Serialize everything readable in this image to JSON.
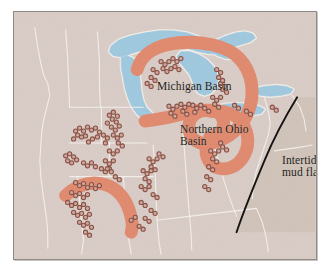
{
  "figure": {
    "kind": "paleogeographic-map",
    "region": "Great Lakes region, United States",
    "frame_border_color": "#8e8a86",
    "page_background": "#ffffff"
  },
  "colors": {
    "land": "#d9ccc6",
    "lake_water": "#9fc8de",
    "lake_outline": "#f2ece8",
    "reef_band": "#e08a6f",
    "mudflat_fill": "#c8bcae",
    "mudflat_line": "#141210",
    "state_border": "#f4efeb",
    "locality_dot_stroke": "#8a5146",
    "locality_dot_fill": "#cfa89c",
    "label_text": "#241f1c"
  },
  "labels": {
    "michigan_basin": "Michigan Basin",
    "northern_ohio_basin_line1": "Northern Ohio",
    "northern_ohio_basin_line2": "Basin",
    "intertidal_line1": "Intertidal",
    "intertidal_line2": "mud flats"
  },
  "legend_semantics": {
    "reef_band_meaning": "Reef trend / carbonate bank margin",
    "dot_meaning": "Fossil locality",
    "mudflat_meaning": "Intertidal mud flats"
  },
  "map_data": {
    "type": "map",
    "lakes": [
      {
        "name": "Lake Superior",
        "path": "M98,34 L106,28 L118,24 L132,21 L146,19 L160,19 L174,21 L186,25 L196,30 L205,28 L214,24 L224,21 L233,20 L240,22 L243,26 L238,30 L228,33 L219,36 L212,40 L205,42 L196,42 L186,40 L176,37 L166,35 L155,34 L144,35 L134,37 L124,40 L115,43 L107,45 L100,44 L96,40 Z"
      },
      {
        "name": "Lake Michigan",
        "path": "M108,45 L114,44 L120,47 L124,53 L126,61 L127,70 L128,80 L130,89 L133,96 L138,101 L140,106 L136,109 L130,108 L124,103 L119,96 L115,87 L112,77 L110,66 L108,56 Z"
      },
      {
        "name": "Lake Huron",
        "path": "M168,40 L177,40 L186,43 L194,48 L200,54 L204,61 L205,69 L203,77 L198,82 L192,84 L186,82 L182,77 L180,70 L177,63 L172,57 L167,51 L164,45 Z"
      },
      {
        "name": "Georgian Bay",
        "path": "M196,34 L205,32 L214,33 L221,37 L224,43 L220,47 L213,47 L205,44 L198,40 Z"
      },
      {
        "name": "Lake Erie",
        "path": "M200,96 L212,93 L224,92 L236,93 L246,95 L252,98 L249,102 L240,104 L228,105 L215,104 L205,101 Z"
      },
      {
        "name": "Lake Ontario",
        "path": "M240,78 L252,75 L264,74 L274,75 L281,78 L278,82 L269,84 L258,85 L248,84 L241,82 Z"
      }
    ],
    "reef_bands": [
      {
        "name": "Michigan Basin reef rim",
        "path": "M124,58 C128,42 144,33 166,31 C190,29 214,34 226,46 C240,60 243,82 236,100 C230,116 216,128 200,132 C186,135 176,128 176,116 C176,106 184,100 194,99 C204,98 211,104 211,112 C211,120 205,126 197,126"
      },
      {
        "name": "Southern Michigan / Indiana reef trend",
        "path": "M132,110 C146,108 160,106 172,102 C182,99 190,98 198,100"
      },
      {
        "name": "Northern Ohio Basin rim",
        "path": "M200,100 C214,99 226,104 232,116 C238,128 236,142 226,152 C216,161 202,160 196,150 C190,140 195,128 204,124"
      },
      {
        "name": "Illinois Basin reef arc",
        "path": "M52,185 C64,174 78,170 92,174 C104,178 112,188 116,200 C119,209 120,216 118,222"
      }
    ],
    "state_borders": [
      "M21,16 L24,36 L27,52 L30,64 L34,72 L36,84 L33,96 L30,108 L28,120 L27,134 L26,150 L27,166 L29,182 L31,196 L33,210 L34,224 L34,238",
      "M52,18 L54,46 L55,72 L56,96",
      "M56,96 L96,96 L130,96",
      "M84,20 L86,50 L86,74 L87,96",
      "M56,132 L96,132 L134,132",
      "M88,96 L88,132",
      "M56,166 L100,166 L140,166",
      "M96,132 L96,166",
      "M64,166 L66,190 L68,212 L70,230 L68,244",
      "M110,166 L112,190 L114,212 L116,232 L118,244",
      "M140,134 L142,160 L143,186 L144,210 L146,232 L148,244",
      "M170,118 L172,146 L174,172 L176,198 L178,220 L179,240",
      "M144,210 L176,206 L210,202 L244,198",
      "M200,130 L206,152 L212,172 L218,190 L224,206",
      "M244,198 L250,212 L254,228 L256,242",
      "M252,86 L256,100 L258,112 L256,124 L252,136 L248,148 L244,160 L241,174 L240,188",
      "M280,84 L288,96 L292,108 L294,120",
      "M262,140 L276,138 L290,136 L300,134"
    ],
    "mudflat": {
      "boundary_line": "M285,86 C274,104 262,126 252,150 C242,174 232,198 224,222",
      "fill_path": "M285,86 C274,104 262,126 252,150 C242,174 232,198 224,222 L303,222 L303,86 Z"
    },
    "locality_dots": [
      [
        62,
        120
      ],
      [
        66,
        117
      ],
      [
        70,
        120
      ],
      [
        64,
        124
      ],
      [
        68,
        126
      ],
      [
        60,
        128
      ],
      [
        72,
        125
      ],
      [
        74,
        116
      ],
      [
        78,
        119
      ],
      [
        82,
        117
      ],
      [
        86,
        121
      ],
      [
        84,
        126
      ],
      [
        79,
        128
      ],
      [
        75,
        131
      ],
      [
        90,
        124
      ],
      [
        94,
        127
      ],
      [
        92,
        132
      ],
      [
        52,
        145
      ],
      [
        56,
        143
      ],
      [
        60,
        146
      ],
      [
        54,
        150
      ],
      [
        58,
        152
      ],
      [
        63,
        149
      ],
      [
        70,
        152
      ],
      [
        74,
        155
      ],
      [
        78,
        152
      ],
      [
        82,
        156
      ],
      [
        88,
        158
      ],
      [
        92,
        161
      ],
      [
        96,
        158
      ],
      [
        62,
        172
      ],
      [
        66,
        175
      ],
      [
        70,
        173
      ],
      [
        74,
        177
      ],
      [
        78,
        174
      ],
      [
        82,
        178
      ],
      [
        86,
        175
      ],
      [
        58,
        182
      ],
      [
        62,
        185
      ],
      [
        66,
        183
      ],
      [
        70,
        187
      ],
      [
        74,
        184
      ],
      [
        54,
        192
      ],
      [
        58,
        195
      ],
      [
        62,
        193
      ],
      [
        66,
        197
      ],
      [
        70,
        194
      ],
      [
        74,
        198
      ],
      [
        60,
        202
      ],
      [
        64,
        205
      ],
      [
        68,
        203
      ],
      [
        72,
        207
      ],
      [
        76,
        204
      ],
      [
        66,
        212
      ],
      [
        70,
        215
      ],
      [
        74,
        213
      ],
      [
        78,
        217
      ],
      [
        72,
        222
      ],
      [
        76,
        225
      ],
      [
        96,
        104
      ],
      [
        100,
        101
      ],
      [
        104,
        105
      ],
      [
        99,
        108
      ],
      [
        103,
        111
      ],
      [
        94,
        112
      ],
      [
        98,
        116
      ],
      [
        102,
        119
      ],
      [
        106,
        115
      ],
      [
        100,
        124
      ],
      [
        104,
        127
      ],
      [
        108,
        124
      ],
      [
        105,
        132
      ],
      [
        109,
        135
      ],
      [
        96,
        140
      ],
      [
        100,
        143
      ],
      [
        104,
        140
      ],
      [
        92,
        150
      ],
      [
        96,
        153
      ],
      [
        100,
        150
      ],
      [
        94,
        158
      ],
      [
        98,
        161
      ],
      [
        102,
        166
      ],
      [
        106,
        169
      ],
      [
        136,
        148
      ],
      [
        140,
        151
      ],
      [
        144,
        148
      ],
      [
        138,
        156
      ],
      [
        142,
        159
      ],
      [
        146,
        143
      ],
      [
        150,
        146
      ],
      [
        130,
        160
      ],
      [
        134,
        163
      ],
      [
        138,
        160
      ],
      [
        132,
        168
      ],
      [
        136,
        171
      ],
      [
        128,
        176
      ],
      [
        132,
        179
      ],
      [
        136,
        176
      ],
      [
        140,
        184
      ],
      [
        144,
        187
      ],
      [
        128,
        192
      ],
      [
        132,
        195
      ],
      [
        138,
        200
      ],
      [
        142,
        203
      ],
      [
        132,
        208
      ],
      [
        136,
        211
      ],
      [
        126,
        216
      ],
      [
        130,
        219
      ],
      [
        118,
        210
      ],
      [
        122,
        207
      ],
      [
        148,
        50
      ],
      [
        152,
        53
      ],
      [
        156,
        50
      ],
      [
        150,
        57
      ],
      [
        154,
        60
      ],
      [
        158,
        57
      ],
      [
        160,
        47
      ],
      [
        164,
        50
      ],
      [
        168,
        47
      ],
      [
        162,
        55
      ],
      [
        166,
        58
      ],
      [
        140,
        58
      ],
      [
        144,
        61
      ],
      [
        138,
        66
      ],
      [
        142,
        69
      ],
      [
        134,
        72
      ],
      [
        138,
        75
      ],
      [
        156,
        95
      ],
      [
        160,
        98
      ],
      [
        164,
        95
      ],
      [
        158,
        102
      ],
      [
        162,
        105
      ],
      [
        168,
        93
      ],
      [
        172,
        96
      ],
      [
        176,
        93
      ],
      [
        170,
        100
      ],
      [
        174,
        103
      ],
      [
        180,
        94
      ],
      [
        184,
        97
      ],
      [
        188,
        94
      ],
      [
        182,
        101
      ],
      [
        192,
        97
      ],
      [
        196,
        100
      ],
      [
        200,
        86
      ],
      [
        204,
        89
      ],
      [
        208,
        86
      ],
      [
        202,
        93
      ],
      [
        206,
        96
      ],
      [
        210,
        78
      ],
      [
        214,
        81
      ],
      [
        208,
        72
      ],
      [
        212,
        75
      ],
      [
        206,
        66
      ],
      [
        210,
        69
      ],
      [
        204,
        58
      ],
      [
        208,
        61
      ],
      [
        222,
        94
      ],
      [
        226,
        97
      ],
      [
        198,
        140
      ],
      [
        202,
        143
      ],
      [
        206,
        140
      ],
      [
        200,
        148
      ],
      [
        204,
        151
      ],
      [
        210,
        136
      ],
      [
        214,
        139
      ],
      [
        208,
        132
      ],
      [
        196,
        156
      ],
      [
        200,
        159
      ],
      [
        194,
        166
      ],
      [
        198,
        169
      ],
      [
        192,
        176
      ],
      [
        196,
        179
      ],
      [
        260,
        96
      ],
      [
        264,
        99
      ],
      [
        234,
        100
      ],
      [
        238,
        103
      ]
    ]
  }
}
